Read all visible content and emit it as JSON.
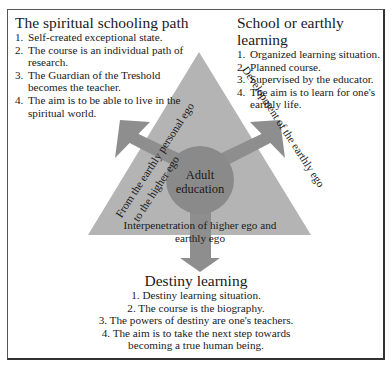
{
  "blocks": {
    "spiritual": {
      "title": "The spiritual schooling path",
      "items": [
        {
          "num": "1.",
          "text": "Self-created exceptional state."
        },
        {
          "num": "2.",
          "text": "The course is an individual path of research."
        },
        {
          "num": "3.",
          "text": "The Guardian of the Treshold becomes the teacher."
        },
        {
          "num": "4.",
          "text": "The aim is to be able to live in the spiritual world."
        }
      ]
    },
    "school": {
      "title": "School or earthly learning",
      "items": [
        {
          "num": "1.",
          "text": "Organized learning situation."
        },
        {
          "num": "2.",
          "text": "Planned course."
        },
        {
          "num": "3.",
          "text": "Supervised by the educator."
        },
        {
          "num": "4.",
          "text": "The aim is to learn for one's earthly life."
        }
      ]
    },
    "destiny": {
      "title": "Destiny learning",
      "items": [
        "1. Destiny learning situation.",
        "2. The course is the biography.",
        "3. The powers of destiny are one's teachers.",
        "4. The aim is to take the next step towards becoming a true human being."
      ]
    }
  },
  "triangle": {
    "center_label_line1": "Adult",
    "center_label_line2": "education",
    "left_arrow_label_line1": "From the earthly personal ego",
    "left_arrow_label_line2": "to the higher ego",
    "right_arrow_label": "Development of the earthly ego",
    "down_arrow_label_line1": "Interpenetration of higher ego and",
    "down_arrow_label_line2": "earthly ego"
  },
  "colors": {
    "triangle_fill": "#b4b4b4",
    "arrow_fill": "#8e8e8e",
    "circle_fill": "#8a8a8a",
    "border": "#333333"
  }
}
